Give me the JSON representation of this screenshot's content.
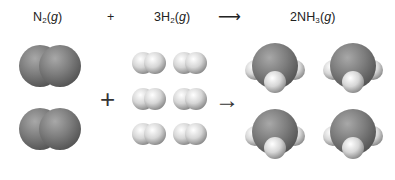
{
  "equation": {
    "reactant1": {
      "coef": "",
      "formula": "N",
      "sub": "2",
      "state": "g"
    },
    "plus": "+",
    "reactant2": {
      "coef": "3",
      "formula": "H",
      "sub": "2",
      "state": "g"
    },
    "arrow": "⟶",
    "product": {
      "coef": "2",
      "formula": "NH",
      "sub": "3",
      "state": "g"
    }
  },
  "diagram": {
    "plus": "+",
    "arrow": "→",
    "n2_count": 2,
    "h2_count": 6,
    "nh3_count": 4,
    "colors": {
      "nitrogen": "#7a7a7a",
      "hydrogen": "#e6e6e6",
      "background": "#ffffff"
    }
  }
}
